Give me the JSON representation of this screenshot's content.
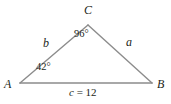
{
  "figure": {
    "type": "triangle-diagram",
    "width": 171,
    "height": 104,
    "background_color": "#ffffff",
    "stroke_color": "#8c8c8c",
    "text_color": "#231f20"
  },
  "vertices": {
    "a": {
      "label": "A",
      "x": 20,
      "y": 83,
      "label_x": 4,
      "label_y": 79
    },
    "b": {
      "label": "B",
      "x": 152,
      "y": 83,
      "label_x": 157,
      "label_y": 79
    },
    "c": {
      "label": "C",
      "x": 88,
      "y": 25,
      "label_x": 84,
      "label_y": 3
    }
  },
  "angles": {
    "at_a": {
      "value": "42",
      "text": "42°",
      "x": 37,
      "y": 62
    },
    "at_c": {
      "value": "96",
      "text": "96°",
      "x": 75,
      "y": 28
    }
  },
  "sides": {
    "a": {
      "label": "a",
      "x": 126,
      "y": 36
    },
    "b": {
      "label": "b",
      "x": 43,
      "y": 37
    },
    "c": {
      "variable": "c",
      "separator": " = ",
      "value": "12",
      "text": "c = 12",
      "x": 69,
      "y": 87
    }
  }
}
